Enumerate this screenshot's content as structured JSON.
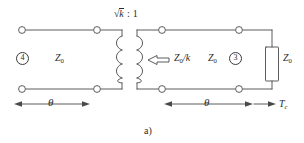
{
  "figure": {
    "caption": "a)",
    "background_color": "#ffffff",
    "line_color": "#4a4a4a",
    "text_color": "#2b2b2b",
    "width": 304,
    "height": 143
  },
  "transformer": {
    "ratio_label": {
      "radical_symbol": "√",
      "radicand": "k",
      "separator": " : ",
      "right_value": "1",
      "full_text": "√k : 1"
    }
  },
  "labels": {
    "port_left": {
      "number": "4",
      "style": "circled"
    },
    "port_right": {
      "number": "3",
      "style": "circled"
    },
    "impedance_left": {
      "symbol": "Z",
      "subscript": "0"
    },
    "impedance_middle": {
      "symbol": "Z",
      "subscript": "0",
      "suffix": "/k"
    },
    "impedance_right": {
      "symbol": "Z",
      "subscript": "0"
    },
    "impedance_load": {
      "symbol": "Z",
      "subscript": "0"
    },
    "theta_left": "θ",
    "theta_right": "θ",
    "reference_plane": {
      "symbol": "T",
      "subscript": "c"
    }
  },
  "arrows": {
    "middle_direction_arrow": {
      "name": "left-pointing-block-arrow",
      "direction": "left"
    },
    "tc_arrow": {
      "name": "right-pointing-arrow",
      "direction": "right"
    },
    "theta_left_dimension": {
      "direction": "both"
    },
    "theta_right_dimension": {
      "direction": "both"
    }
  },
  "terminals": [
    {
      "name": "terminal-top-left",
      "x": 22,
      "y": 30
    },
    {
      "name": "terminal-top-mid-left",
      "x": 97,
      "y": 30
    },
    {
      "name": "terminal-top-mid-right",
      "x": 162,
      "y": 30
    },
    {
      "name": "terminal-top-right",
      "x": 239,
      "y": 30
    },
    {
      "name": "terminal-bottom-left",
      "x": 22,
      "y": 89
    },
    {
      "name": "terminal-bottom-mid-left",
      "x": 97,
      "y": 89
    },
    {
      "name": "terminal-bottom-mid-right",
      "x": 162,
      "y": 89
    },
    {
      "name": "terminal-bottom-right",
      "x": 239,
      "y": 89
    }
  ]
}
